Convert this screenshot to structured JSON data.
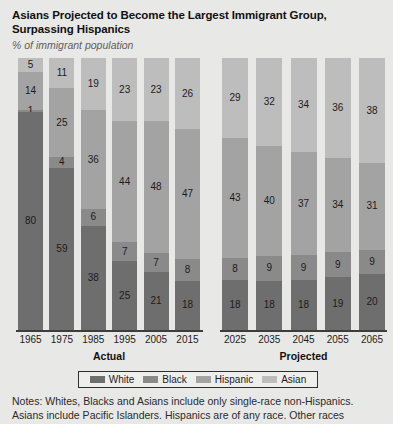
{
  "header": {
    "title_line1": "Asians Projected to Become the Largest Immigrant Group,",
    "title_line2": "Surpassing Hispanics",
    "subtitle": "% of immigrant population"
  },
  "groups": {
    "actual_label": "Actual",
    "projected_label": "Projected"
  },
  "legend": {
    "items": [
      {
        "label": "White",
        "color": "#6e6e6e"
      },
      {
        "label": "Black",
        "color": "#8a8a8a"
      },
      {
        "label": "Hispanic",
        "color": "#a3a3a3"
      },
      {
        "label": "Asian",
        "color": "#bdbdbd"
      }
    ]
  },
  "notes": {
    "line1": "Notes: Whites, Blacks and Asians include only single-race non-Hispanics.",
    "line2": "Asians include Pacific Islanders. Hispanics are of any race. Other races"
  },
  "chart_data": {
    "type": "bar",
    "title": "Asians Projected to Become the Largest Immigrant Group, Surpassing Hispanics",
    "subtitle": "% of immigrant population",
    "xlabel": "",
    "ylabel": "% of immigrant population",
    "ylim": [
      0,
      100
    ],
    "grid": false,
    "stacked": true,
    "legend_position": "bottom",
    "stack_order_top_to_bottom": [
      "Asian",
      "Hispanic",
      "Black",
      "White"
    ],
    "categories": [
      "1965",
      "1975",
      "1985",
      "1995",
      "2005",
      "2015",
      "2025",
      "2035",
      "2045",
      "2055",
      "2065"
    ],
    "panels": [
      {
        "name": "Actual",
        "categories": [
          "1965",
          "1975",
          "1985",
          "1995",
          "2005",
          "2015"
        ]
      },
      {
        "name": "Projected",
        "categories": [
          "2025",
          "2035",
          "2045",
          "2055",
          "2065"
        ]
      }
    ],
    "series": [
      {
        "name": "White",
        "color": "#6e6e6e",
        "values": [
          80,
          59,
          38,
          25,
          21,
          18,
          18,
          18,
          18,
          19,
          20
        ]
      },
      {
        "name": "Black",
        "color": "#8a8a8a",
        "values": [
          1,
          4,
          6,
          7,
          7,
          8,
          8,
          9,
          9,
          9,
          9
        ]
      },
      {
        "name": "Hispanic",
        "color": "#a3a3a3",
        "values": [
          14,
          25,
          36,
          44,
          48,
          47,
          43,
          40,
          37,
          34,
          31
        ]
      },
      {
        "name": "Asian",
        "color": "#bdbdbd",
        "values": [
          5,
          11,
          19,
          23,
          23,
          26,
          29,
          32,
          34,
          36,
          38
        ]
      }
    ]
  }
}
